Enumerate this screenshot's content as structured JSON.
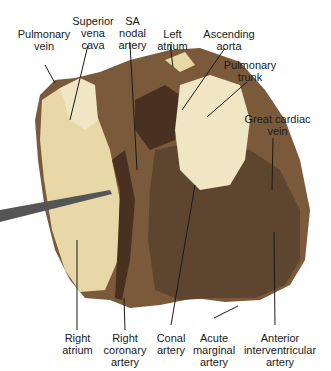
{
  "figure": {
    "labels": {
      "pulmonary_vein": "Pulmonary\nvein",
      "superior_vena_cava": "Superior\nvena\ncava",
      "sa_nodal_artery": "SA\nnodal\nartery",
      "left_atrium": "Left\natrium",
      "ascending_aorta": "Ascending\naorta",
      "pulmonary_trunk": "Pulmonary\ntrunk",
      "great_cardiac_vein": "Great cardiac\nvein",
      "right_atrium": "Right\natrium",
      "right_coronary_artery": "Right\ncoronary\nartery",
      "conal_artery": "Conal\nartery",
      "acute_marginal_artery": "Acute\nmarginal\nartery",
      "anterior_interventricular_artery": "Anterior\ninterventricular\nartery"
    },
    "colors": {
      "background": "#ffffff",
      "tissue_main": "#7a5a3a",
      "tissue_light": "#e8d8a8",
      "tissue_pale": "#f0e6c4",
      "tissue_dark": "#4a3020",
      "leader_line": "#1a1a1a"
    }
  }
}
